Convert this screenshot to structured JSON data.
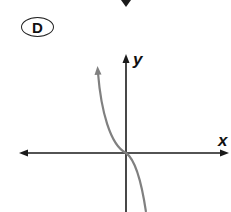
{
  "option": {
    "label": "D"
  },
  "graph": {
    "x_axis_label": "x",
    "y_axis_label": "y",
    "curve_description": "decreasing cubic through origin (y = -x^3)",
    "colors": {
      "axes": "#1a1a1a",
      "curve": "#808080",
      "label": "#111111"
    }
  }
}
